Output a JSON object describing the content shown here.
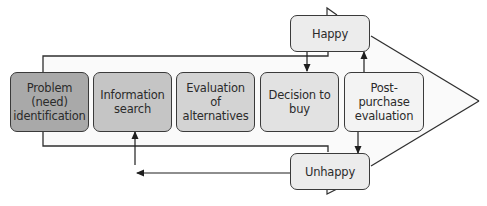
{
  "diagram": {
    "stages": [
      {
        "label": "Problem (need) identification",
        "lines": [
          "Problem",
          "(need)",
          "identification"
        ],
        "fill": "#a9a9a9"
      },
      {
        "label": "Information search",
        "lines": [
          "Information",
          "search"
        ],
        "fill": "#c5c5c5"
      },
      {
        "label": "Evaluation of alternatives",
        "lines": [
          "Evaluation of",
          "alternatives"
        ],
        "fill": "#d3d3d3"
      },
      {
        "label": "Decision to buy",
        "lines": [
          "Decision to",
          "buy"
        ],
        "fill": "#e2e2e2"
      },
      {
        "label": "Post-purchase evaluation",
        "lines": [
          "Post-purchase",
          "evaluation"
        ],
        "fill": "#f3f3f3"
      }
    ],
    "outcomes": {
      "happy": {
        "label": "Happy",
        "fill": "#ececec"
      },
      "unhappy": {
        "label": "Unhappy",
        "fill": "#ececec"
      }
    },
    "flows": [
      {
        "from": "Post-purchase evaluation",
        "to": "Happy"
      },
      {
        "from": "Happy",
        "to": "Decision to buy"
      },
      {
        "from": "Post-purchase evaluation",
        "to": "Unhappy"
      },
      {
        "from": "Unhappy",
        "to": "Information search"
      }
    ],
    "colors": {
      "arrow_fill": "#fafafa",
      "stroke": "#2f2f2f",
      "text": "#2b2b2b"
    }
  }
}
